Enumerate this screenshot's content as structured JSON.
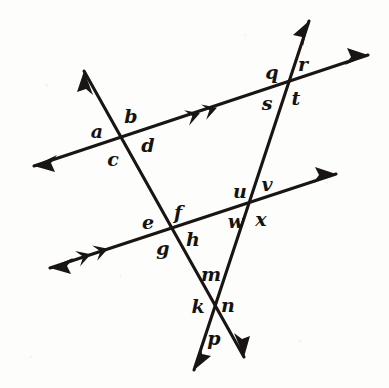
{
  "figure": {
    "canvas": {
      "width": 389,
      "height": 388
    },
    "stroke_color": "#181512",
    "background_color": "#fdfdfb",
    "stroke_width": 3.1
  },
  "lines": [
    {
      "id": "upper-parallel-line",
      "role": "parallel",
      "tick_marks": 2,
      "from": {
        "x": 34,
        "y": 166
      },
      "to": {
        "x": 368,
        "y": 55
      },
      "arrow_start": true,
      "arrow_end": true
    },
    {
      "id": "lower-parallel-line",
      "role": "parallel",
      "tick_marks": 2,
      "from": {
        "x": 50,
        "y": 268
      },
      "to": {
        "x": 336,
        "y": 174
      },
      "arrow_start": true,
      "arrow_end": true
    },
    {
      "id": "left-transversal-line",
      "role": "transversal",
      "tick_marks": 0,
      "from": {
        "x": 84,
        "y": 71
      },
      "to": {
        "x": 244,
        "y": 357
      },
      "arrow_start": true,
      "arrow_end": true
    },
    {
      "id": "right-transversal-line",
      "role": "transversal",
      "tick_marks": 0,
      "from": {
        "x": 309,
        "y": 21
      },
      "to": {
        "x": 194,
        "y": 370
      },
      "arrow_start": true,
      "arrow_end": true
    }
  ],
  "intersections": [
    {
      "id": "intersection-upper-left",
      "x": 122,
      "y": 139,
      "labels": [
        "a",
        "b",
        "c",
        "d"
      ]
    },
    {
      "id": "intersection-upper-right",
      "x": 288,
      "y": 86,
      "labels": [
        "q",
        "r",
        "s",
        "t"
      ]
    },
    {
      "id": "intersection-lower-left",
      "x": 172,
      "y": 230,
      "labels": [
        "e",
        "f",
        "g",
        "h"
      ]
    },
    {
      "id": "intersection-lower-right",
      "x": 251,
      "y": 204,
      "labels": [
        "u",
        "v",
        "w",
        "x"
      ]
    },
    {
      "id": "intersection-bottom",
      "x": 213,
      "y": 303,
      "labels": [
        "m",
        "k",
        "n",
        "p"
      ]
    }
  ],
  "labels": [
    {
      "name": "angle-label-a",
      "text": "a",
      "x": 97,
      "y": 131
    },
    {
      "name": "angle-label-b",
      "text": "b",
      "x": 131,
      "y": 116
    },
    {
      "name": "angle-label-c",
      "text": "c",
      "x": 113,
      "y": 159
    },
    {
      "name": "angle-label-d",
      "text": "d",
      "x": 148,
      "y": 145
    },
    {
      "name": "angle-label-q",
      "text": "q",
      "x": 272,
      "y": 72
    },
    {
      "name": "angle-label-r",
      "text": "r",
      "x": 303,
      "y": 64
    },
    {
      "name": "angle-label-s",
      "text": "s",
      "x": 267,
      "y": 103
    },
    {
      "name": "angle-label-t",
      "text": "t",
      "x": 296,
      "y": 98
    },
    {
      "name": "angle-label-e",
      "text": "e",
      "x": 148,
      "y": 222
    },
    {
      "name": "angle-label-f",
      "text": "f",
      "x": 178,
      "y": 212
    },
    {
      "name": "angle-label-g",
      "text": "g",
      "x": 163,
      "y": 248
    },
    {
      "name": "angle-label-h",
      "text": "h",
      "x": 193,
      "y": 239
    },
    {
      "name": "angle-label-u",
      "text": "u",
      "x": 240,
      "y": 191
    },
    {
      "name": "angle-label-v",
      "text": "v",
      "x": 267,
      "y": 184
    },
    {
      "name": "angle-label-w",
      "text": "w",
      "x": 236,
      "y": 221
    },
    {
      "name": "angle-label-x",
      "text": "x",
      "x": 261,
      "y": 219
    },
    {
      "name": "angle-label-m",
      "text": "m",
      "x": 211,
      "y": 274
    },
    {
      "name": "angle-label-k",
      "text": "k",
      "x": 198,
      "y": 306
    },
    {
      "name": "angle-label-n",
      "text": "n",
      "x": 228,
      "y": 305
    },
    {
      "name": "angle-label-p",
      "text": "p",
      "x": 214,
      "y": 338
    }
  ],
  "parallel_marks": [
    {
      "name": "parallel-mark-upper",
      "cx": 216,
      "cy": 108,
      "angle_deg": -18.4
    },
    {
      "name": "parallel-mark-lower",
      "cx": 107,
      "cy": 249,
      "angle_deg": -18.2
    }
  ]
}
